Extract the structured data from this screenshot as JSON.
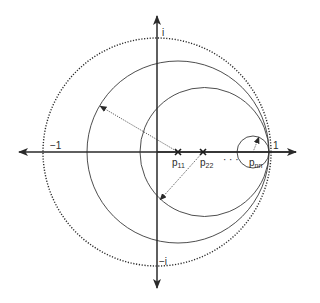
{
  "diagram": {
    "type": "complex-plane-circles",
    "colors": {
      "stroke": "#2a2a2a",
      "background": "#ffffff"
    },
    "axes": {
      "origin": [
        157,
        152
      ],
      "x_range_px": [
        18,
        297
      ],
      "y_range_px": [
        15,
        289
      ],
      "labels": {
        "real_neg": "−1",
        "real_pos": "1",
        "imag_pos": "i",
        "imag_neg": "−i"
      }
    },
    "unit_circle": {
      "cx": 157,
      "cy": 152,
      "r": 114,
      "style": "dotted"
    },
    "circles": [
      {
        "name": "circle-p11",
        "cx": 178,
        "cy": 152,
        "r": 91
      },
      {
        "name": "circle-p22",
        "cx": 204.5,
        "cy": 152,
        "r": 64.5
      },
      {
        "name": "circle-pnn",
        "cx": 253,
        "cy": 152,
        "r": 16
      }
    ],
    "points": [
      {
        "name": "p11",
        "label_base": "p",
        "label_sub": "11",
        "x": 178,
        "y": 152
      },
      {
        "name": "p22",
        "label_base": "p",
        "label_sub": "22",
        "x": 203,
        "y": 152
      },
      {
        "name": "pnn",
        "label_base": "p",
        "label_sub": "nn",
        "x": 253,
        "y": 152
      }
    ],
    "ellipsis": "· · ·",
    "radius_arrows": [
      {
        "from": [
          178,
          152
        ],
        "to": [
          100,
          106
        ]
      },
      {
        "from": [
          203,
          152
        ],
        "to": [
          160,
          200
        ]
      },
      {
        "from": [
          253,
          152
        ],
        "to": [
          259,
          137
        ]
      }
    ]
  }
}
